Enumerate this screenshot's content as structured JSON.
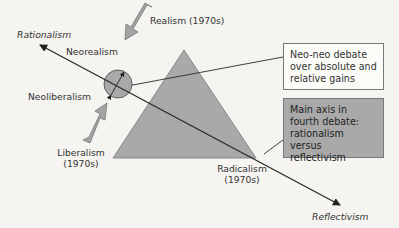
{
  "diagram": {
    "axis": {
      "start_label": "Rationalism",
      "end_label": "Reflectivism"
    },
    "nodes": {
      "realism": "Realism (1970s)",
      "neorealism": "Neorealism",
      "neoliberalism": "Neoliberalism",
      "liberalism_line1": "Liberalism",
      "liberalism_line2": "(1970s)",
      "radicalism_line1": "Radicalism",
      "radicalism_line2": "(1970s)"
    },
    "callouts": {
      "neo_neo": "Neo-neo debate over absolute and relative gains",
      "main_axis": "Main axis in fourth debate: rationalism versus reflectivism"
    },
    "colors": {
      "background": "#f5f4f0",
      "triangle_fill": "#a9a9a9",
      "arrow_fill": "#a3a3a3",
      "line": "#2a2a2a",
      "callout_grey": "#a9a9a9"
    }
  }
}
